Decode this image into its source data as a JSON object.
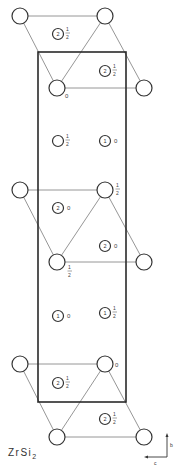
{
  "title": {
    "formula": "ZrSi",
    "subscript": "2"
  },
  "axes": {
    "vertical": "b",
    "horizontal": "c"
  },
  "unit_cell": {
    "x": 38,
    "y": 52,
    "width": 88,
    "height": 350
  },
  "zr_atoms": [
    {
      "x": 20,
      "y": 16,
      "height": ""
    },
    {
      "x": 105,
      "y": 16,
      "height": ""
    },
    {
      "x": 57,
      "y": 88,
      "height": "0"
    },
    {
      "x": 144,
      "y": 88,
      "height": ""
    },
    {
      "x": 20,
      "y": 190,
      "height": ""
    },
    {
      "x": 105,
      "y": 190,
      "height": "1/2"
    },
    {
      "x": 57,
      "y": 262,
      "height": "1/2"
    },
    {
      "x": 144,
      "y": 262,
      "height": ""
    },
    {
      "x": 20,
      "y": 364,
      "height": ""
    },
    {
      "x": 105,
      "y": 364,
      "height": "0"
    },
    {
      "x": 57,
      "y": 437,
      "height": ""
    },
    {
      "x": 144,
      "y": 437,
      "height": ""
    }
  ],
  "si_atoms": [
    {
      "x": 58,
      "y": 34,
      "type": "2",
      "height": "1/2"
    },
    {
      "x": 105,
      "y": 71,
      "type": "2",
      "height": "1/2"
    },
    {
      "x": 58,
      "y": 141,
      "type": "",
      "height": "1/2"
    },
    {
      "x": 105,
      "y": 141,
      "type": "1",
      "height": "0"
    },
    {
      "x": 58,
      "y": 208,
      "type": "2",
      "height": "0"
    },
    {
      "x": 105,
      "y": 246,
      "type": "2",
      "height": "0"
    },
    {
      "x": 58,
      "y": 316,
      "type": "1",
      "height": "0"
    },
    {
      "x": 105,
      "y": 313,
      "type": "1",
      "height": "1/2"
    },
    {
      "x": 58,
      "y": 383,
      "type": "2",
      "height": "1/2"
    },
    {
      "x": 105,
      "y": 419,
      "type": "2",
      "height": "1/2"
    }
  ]
}
